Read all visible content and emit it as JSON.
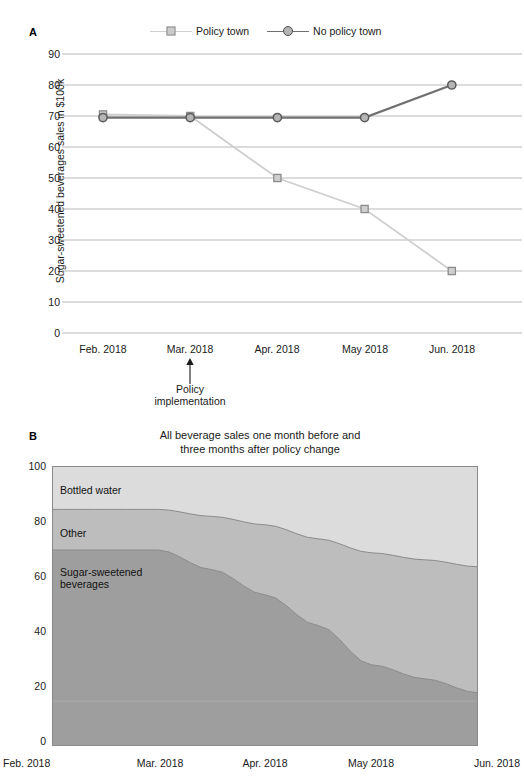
{
  "figure": {
    "panel_a_letter": "A",
    "panel_b_letter": "B"
  },
  "panel_a": {
    "ylabel": "Sugar-sweetened beverages sales in $100k",
    "legend": [
      {
        "label": "Policy town",
        "marker": "square-marker",
        "color": "#c8c8c8",
        "edge": "#8c8c8c"
      },
      {
        "label": "No policy town",
        "marker": "circle-marker",
        "color": "#b3b3b3",
        "edge": "#4d4d4d"
      }
    ],
    "annotation": {
      "line1": "Policy",
      "line2": "implementation",
      "at_category": "Mar. 2018"
    },
    "chart_data": {
      "type": "line",
      "title": "",
      "xlabel": "",
      "ylabel": "Sugar-sweetened beverages sales in $100k",
      "categories": [
        "Feb. 2018",
        "Mar. 2018",
        "Apr. 2018",
        "May 2018",
        "Jun. 2018"
      ],
      "yticks": [
        0,
        10,
        20,
        30,
        40,
        50,
        60,
        70,
        80,
        90
      ],
      "ylim": [
        0,
        95
      ],
      "grid": "horizontal",
      "legend_position": "top",
      "series": [
        {
          "name": "Policy town",
          "values": [
            70.5,
            70,
            50,
            40,
            20
          ],
          "color": "#cfcfcf",
          "marker": "square"
        },
        {
          "name": "No policy town",
          "values": [
            69.5,
            69.5,
            69.5,
            69.5,
            80
          ],
          "color": "#707070",
          "marker": "circle"
        }
      ]
    }
  },
  "panel_b": {
    "title_line1": "All beverage sales one month before and",
    "title_line2": "three months after policy change",
    "area_labels": [
      {
        "text": "Bottled water"
      },
      {
        "text": "Other"
      },
      {
        "text_line1": "Sugar-sweetened",
        "text_line2": "beverages"
      }
    ],
    "chart_data": {
      "type": "area",
      "title": "All beverage sales one month before and three months after policy change",
      "xlabel": "",
      "ylabel": "",
      "categories": [
        "Feb. 2018",
        "Mar. 2018",
        "Apr. 2018",
        "May 2018",
        "Jun. 2018"
      ],
      "yticks": [
        0,
        20,
        40,
        60,
        80,
        100
      ],
      "ylim": [
        0,
        100
      ],
      "stacked": true,
      "grid": "none",
      "legend_position": "inline-labels",
      "series": [
        {
          "name": "Sugar-sweetened beverages",
          "values": [
            70,
            70,
            54,
            29,
            19
          ],
          "color": "#9e9e9e"
        },
        {
          "name": "Other",
          "values": [
            14.5,
            14.5,
            25,
            40,
            45
          ],
          "color": "#bdbdbd"
        },
        {
          "name": "Bottled water",
          "values": [
            15.5,
            15.5,
            21,
            31,
            36
          ],
          "color": "#dcdcdc"
        }
      ],
      "cumulative_top_ssb": [
        70,
        70,
        54,
        29,
        19
      ],
      "cumulative_top_other": [
        84.5,
        84.5,
        79,
        69,
        64
      ]
    }
  }
}
